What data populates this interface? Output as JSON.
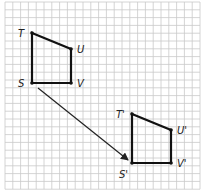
{
  "diagram": {
    "type": "translation",
    "grid": {
      "x0": 5,
      "y0": 2,
      "cell": 7.8,
      "cols": 25,
      "rows": 24,
      "line_color": "#c9c9c9"
    },
    "colors": {
      "shape": "#111111",
      "arrow": "#222222",
      "label": "#222222"
    },
    "original": {
      "name": "TUVS",
      "vertices": [
        {
          "id": "T",
          "label": "T",
          "x": 32,
          "y": 33,
          "lx": 18,
          "ly": 37
        },
        {
          "id": "U",
          "label": "U",
          "x": 71,
          "y": 49,
          "lx": 77,
          "ly": 53
        },
        {
          "id": "V",
          "label": "V",
          "x": 71,
          "y": 83,
          "lx": 77,
          "ly": 87
        },
        {
          "id": "S",
          "label": "S",
          "x": 32,
          "y": 83,
          "lx": 18,
          "ly": 87
        }
      ]
    },
    "image": {
      "name": "T'U'V'S'",
      "vertices": [
        {
          "id": "T'",
          "label": "T'",
          "x": 132,
          "y": 114,
          "lx": 116,
          "ly": 118
        },
        {
          "id": "U'",
          "label": "U'",
          "x": 171,
          "y": 130,
          "lx": 177,
          "ly": 134
        },
        {
          "id": "V'",
          "label": "V'",
          "x": 171,
          "y": 163,
          "lx": 177,
          "ly": 167
        },
        {
          "id": "S'",
          "label": "S'",
          "x": 132,
          "y": 163,
          "lx": 119,
          "ly": 178
        }
      ]
    },
    "translation_arrow": {
      "from": {
        "x": 38,
        "y": 88
      },
      "to": {
        "x": 128,
        "y": 160
      }
    }
  }
}
